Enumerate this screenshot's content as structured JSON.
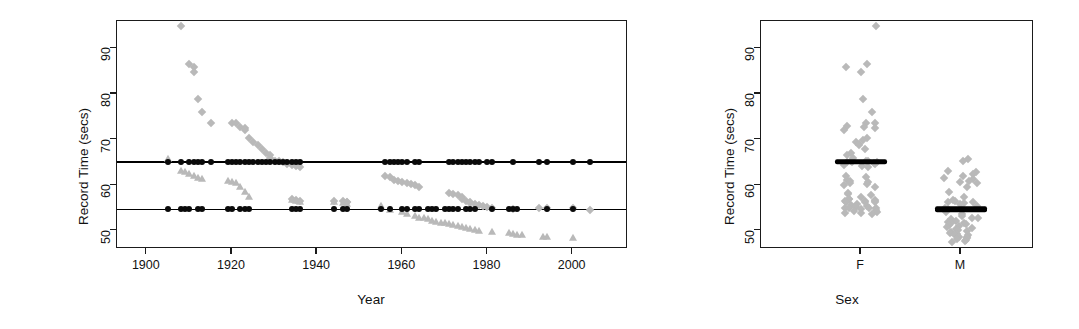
{
  "figure": {
    "panels": [
      "record-time-vs-year",
      "record-time-by-sex"
    ]
  },
  "chart_data": [
    {
      "id": "left",
      "type": "scatter",
      "title": "",
      "xlabel": "Year",
      "ylabel": "Record Time (secs)",
      "xlim": [
        1893,
        2013
      ],
      "ylim": [
        46,
        96
      ],
      "xticks": [
        1900,
        1920,
        1940,
        1960,
        1980,
        2000
      ],
      "yticks": [
        50,
        60,
        70,
        80,
        90
      ],
      "grid": false,
      "legend": "none",
      "reference_lines": [
        {
          "name": "female-median-line",
          "y": 65.1,
          "color": "#000000"
        },
        {
          "name": "male-median-line",
          "y": 54.7,
          "color": "#000000"
        }
      ],
      "series": [
        {
          "name": "Female record time",
          "marker": "diamond",
          "color": "#b9b9b9",
          "points": [
            [
              1908,
              95.0
            ],
            [
              1910,
              86.6
            ],
            [
              1911,
              86.0
            ],
            [
              1911,
              84.8
            ],
            [
              1912,
              78.8
            ],
            [
              1913,
              76.0
            ],
            [
              1915,
              73.6
            ],
            [
              1920,
              73.6
            ],
            [
              1921,
              73.6
            ],
            [
              1922,
              72.8
            ],
            [
              1923,
              72.6
            ],
            [
              1923,
              72.0
            ],
            [
              1924,
              70.4
            ],
            [
              1925,
              69.4
            ],
            [
              1926,
              68.8
            ],
            [
              1927,
              68.0
            ],
            [
              1928,
              67.0
            ],
            [
              1929,
              66.6
            ],
            [
              1929,
              66.0
            ],
            [
              1930,
              65.4
            ],
            [
              1931,
              65.4
            ],
            [
              1932,
              65.0
            ],
            [
              1933,
              64.6
            ],
            [
              1934,
              64.4
            ],
            [
              1956,
              62.0
            ],
            [
              1957,
              61.8
            ],
            [
              1958,
              61.2
            ],
            [
              1959,
              61.0
            ],
            [
              1960,
              60.8
            ],
            [
              1961,
              60.4
            ],
            [
              1962,
              60.2
            ],
            [
              1963,
              60.0
            ],
            [
              1964,
              59.6
            ],
            [
              1971,
              58.2
            ],
            [
              1972,
              58.0
            ],
            [
              1973,
              57.8
            ],
            [
              1974,
              57.4
            ],
            [
              1974,
              57.0
            ],
            [
              1975,
              56.6
            ],
            [
              1976,
              56.2
            ],
            [
              1977,
              55.8
            ],
            [
              1978,
              55.6
            ],
            [
              1979,
              55.4
            ],
            [
              1980,
              55.2
            ],
            [
              1981,
              55.0
            ],
            [
              1986,
              54.8
            ],
            [
              1992,
              54.9
            ],
            [
              1994,
              54.9
            ],
            [
              2000,
              54.9
            ],
            [
              2004,
              54.6
            ],
            [
              1935,
              64.2
            ],
            [
              1936,
              64.0
            ],
            [
              1946,
              56.6
            ],
            [
              1947,
              56.4
            ],
            [
              1947,
              56.2
            ],
            [
              1934,
              56.9
            ],
            [
              1935,
              56.7
            ],
            [
              1936,
              56.5
            ],
            [
              1944,
              56.6
            ],
            [
              1976,
              56.0
            ]
          ]
        },
        {
          "name": "Male record time",
          "marker": "triangle",
          "color": "#b9b9b9",
          "points": [
            [
              1905,
              65.8
            ],
            [
              1908,
              63.2
            ],
            [
              1909,
              62.8
            ],
            [
              1910,
              62.4
            ],
            [
              1911,
              62.0
            ],
            [
              1912,
              61.6
            ],
            [
              1913,
              61.4
            ],
            [
              1919,
              61.0
            ],
            [
              1920,
              60.8
            ],
            [
              1921,
              60.4
            ],
            [
              1922,
              59.6
            ],
            [
              1923,
              58.6
            ],
            [
              1924,
              57.4
            ],
            [
              1934,
              56.8
            ],
            [
              1935,
              56.6
            ],
            [
              1936,
              56.4
            ],
            [
              1944,
              56.2
            ],
            [
              1946,
              56.0
            ],
            [
              1947,
              55.8
            ],
            [
              1955,
              55.4
            ],
            [
              1957,
              54.6
            ],
            [
              1960,
              54.2
            ],
            [
              1961,
              53.6
            ],
            [
              1963,
              53.2
            ],
            [
              1964,
              52.8
            ],
            [
              1966,
              52.6
            ],
            [
              1967,
              52.2
            ],
            [
              1968,
              52.0
            ],
            [
              1970,
              51.6
            ],
            [
              1971,
              51.4
            ],
            [
              1972,
              51.2
            ],
            [
              1973,
              51.0
            ],
            [
              1975,
              50.6
            ],
            [
              1976,
              50.4
            ],
            [
              1977,
              50.2
            ],
            [
              1981,
              49.8
            ],
            [
              1985,
              49.4
            ],
            [
              1986,
              49.2
            ],
            [
              1987,
              49.0
            ],
            [
              1994,
              48.6
            ],
            [
              2000,
              48.4
            ],
            [
              1965,
              52.9
            ],
            [
              1969,
              51.8
            ],
            [
              1974,
              50.8
            ],
            [
              1978,
              50.0
            ],
            [
              1988,
              49.1
            ],
            [
              1993,
              48.7
            ]
          ]
        },
        {
          "name": "Female records on reference line",
          "marker": "circle",
          "color": "#0a0a0a",
          "y": 65.1,
          "x_values": [
            1905,
            1908,
            1910,
            1911,
            1912,
            1913,
            1915,
            1919,
            1920,
            1921,
            1922,
            1923,
            1924,
            1925,
            1926,
            1927,
            1928,
            1929,
            1930,
            1931,
            1932,
            1933,
            1934,
            1935,
            1936,
            1956,
            1957,
            1958,
            1959,
            1960,
            1961,
            1963,
            1964,
            1971,
            1972,
            1973,
            1974,
            1975,
            1976,
            1977,
            1978,
            1980,
            1981,
            1986,
            1992,
            1994,
            2000,
            2004
          ]
        },
        {
          "name": "Male records on reference line",
          "marker": "circle",
          "color": "#0a0a0a",
          "y": 54.7,
          "x_values": [
            1905,
            1908,
            1909,
            1910,
            1912,
            1913,
            1919,
            1920,
            1922,
            1923,
            1924,
            1934,
            1935,
            1936,
            1944,
            1946,
            1947,
            1955,
            1957,
            1960,
            1961,
            1963,
            1964,
            1966,
            1967,
            1968,
            1970,
            1971,
            1972,
            1973,
            1975,
            1976,
            1977,
            1981,
            1985,
            1986,
            1987,
            1994,
            2000
          ]
        }
      ]
    },
    {
      "id": "right",
      "type": "scatter",
      "title": "",
      "xlabel": "Sex",
      "ylabel": "Record Time (secs)",
      "categories": [
        "F",
        "M"
      ],
      "ylim": [
        46,
        96
      ],
      "yticks": [
        50,
        60,
        70,
        80,
        90
      ],
      "grid": false,
      "legend": "none",
      "medians": [
        {
          "category": "F",
          "value": 65.1
        },
        {
          "category": "M",
          "value": 54.7
        }
      ],
      "series": [
        {
          "name": "F",
          "marker": "diamond",
          "color": "#b9b9b9",
          "values": [
            95.0,
            86.6,
            86.0,
            84.8,
            78.8,
            76.0,
            73.6,
            73.6,
            73.0,
            72.8,
            72.6,
            72.0,
            70.4,
            70.0,
            69.4,
            69.0,
            68.8,
            68.0,
            67.0,
            66.6,
            66.0,
            65.4,
            65.4,
            65.2,
            65.1,
            65.1,
            65.0,
            64.8,
            64.6,
            64.4,
            64.2,
            64.0,
            62.0,
            61.8,
            61.2,
            61.0,
            60.8,
            60.4,
            60.2,
            60.0,
            59.6,
            58.2,
            58.0,
            57.8,
            57.4,
            57.0,
            56.9,
            56.7,
            56.6,
            56.6,
            56.5,
            56.4,
            56.2,
            56.2,
            55.8,
            55.6,
            55.4,
            55.2,
            55.0,
            54.9,
            54.9,
            54.9,
            54.8,
            54.6,
            54.4,
            54.2,
            54.0,
            53.8,
            53.6
          ]
        },
        {
          "name": "M",
          "marker": "diamond",
          "color": "#b9b9b9",
          "values": [
            65.8,
            65.4,
            63.2,
            62.8,
            62.4,
            62.0,
            61.6,
            61.4,
            61.0,
            60.8,
            60.4,
            59.6,
            58.6,
            57.4,
            56.8,
            56.6,
            56.4,
            56.2,
            56.0,
            55.8,
            55.4,
            55.0,
            54.7,
            54.7,
            54.6,
            54.2,
            53.6,
            53.2,
            52.9,
            52.8,
            52.6,
            52.2,
            52.0,
            51.8,
            51.6,
            51.4,
            51.2,
            51.0,
            50.8,
            50.6,
            50.4,
            50.2,
            50.0,
            49.8,
            49.4,
            49.2,
            49.1,
            49.0,
            48.7,
            48.6,
            48.4,
            48.2,
            48.0,
            47.8,
            47.6
          ]
        }
      ]
    }
  ],
  "left_panel": {
    "y_axis_label": "Record Time (secs)",
    "x_axis_label": "Year",
    "x_tick_labels": [
      "1900",
      "1920",
      "1940",
      "1960",
      "1980",
      "2000"
    ],
    "y_tick_labels": [
      "50",
      "60",
      "70",
      "80",
      "90"
    ]
  },
  "right_panel": {
    "y_axis_label": "Record Time (secs)",
    "x_axis_label": "Sex",
    "x_tick_labels": [
      "F",
      "M"
    ],
    "y_tick_labels": [
      "50",
      "60",
      "70",
      "80",
      "90"
    ]
  },
  "colors": {
    "marker_gray": "#b9b9b9",
    "marker_black": "#0a0a0a",
    "axis": "#1b1b1b"
  }
}
